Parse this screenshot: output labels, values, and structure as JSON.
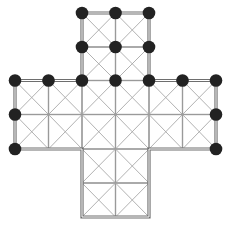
{
  "diagram": {
    "title": "",
    "shape": "cross-shaped grid",
    "colors": {
      "background": "#ffffff",
      "grid_line": "#9a9a9a",
      "diagonal_line": "#a8a8a8",
      "outline": "#6e6e6e",
      "node": "#222222"
    },
    "grid": {
      "x": [
        15,
        48.5,
        82,
        115.5,
        149,
        182.5,
        216
      ],
      "y": [
        13,
        47,
        80.5,
        114.5,
        149,
        183,
        217
      ]
    },
    "cells": [
      [
        2,
        0
      ],
      [
        3,
        0
      ],
      [
        2,
        1
      ],
      [
        3,
        1
      ],
      [
        0,
        2
      ],
      [
        1,
        2
      ],
      [
        2,
        2
      ],
      [
        3,
        2
      ],
      [
        4,
        2
      ],
      [
        5,
        2
      ],
      [
        0,
        3
      ],
      [
        1,
        3
      ],
      [
        2,
        3
      ],
      [
        3,
        3
      ],
      [
        4,
        3
      ],
      [
        5,
        3
      ],
      [
        2,
        4
      ],
      [
        3,
        4
      ],
      [
        2,
        5
      ],
      [
        3,
        5
      ]
    ],
    "outline": [
      [
        2,
        0
      ],
      [
        4,
        0
      ],
      [
        4,
        2
      ],
      [
        6,
        2
      ],
      [
        6,
        4
      ],
      [
        4,
        4
      ],
      [
        4,
        6
      ],
      [
        2,
        6
      ],
      [
        2,
        4
      ],
      [
        0,
        4
      ],
      [
        0,
        2
      ],
      [
        2,
        2
      ]
    ],
    "nodes": [
      [
        2,
        0
      ],
      [
        3,
        0
      ],
      [
        4,
        0
      ],
      [
        2,
        1
      ],
      [
        3,
        1
      ],
      [
        4,
        1
      ],
      [
        0,
        2
      ],
      [
        1,
        2
      ],
      [
        2,
        2
      ],
      [
        3,
        2
      ],
      [
        4,
        2
      ],
      [
        5,
        2
      ],
      [
        6,
        2
      ],
      [
        0,
        3
      ],
      [
        6,
        3
      ],
      [
        0,
        4
      ],
      [
        6,
        4
      ]
    ],
    "node_count": 17
  }
}
